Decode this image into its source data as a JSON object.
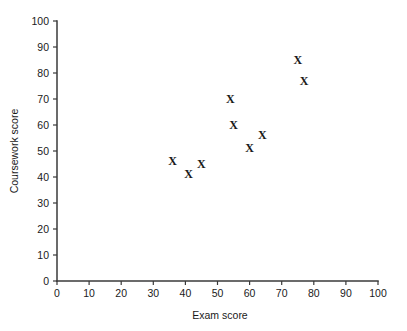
{
  "chart_data": {
    "type": "scatter",
    "title": "",
    "xlabel": "Exam score",
    "ylabel": "Coursework score",
    "xlim": [
      0,
      100
    ],
    "ylim": [
      0,
      100
    ],
    "xticks": [
      0,
      10,
      20,
      30,
      40,
      50,
      60,
      70,
      80,
      90,
      100
    ],
    "yticks": [
      0,
      10,
      20,
      30,
      40,
      50,
      60,
      70,
      80,
      90,
      100
    ],
    "xtick_labels": [
      "0",
      "10",
      "20",
      "30",
      "40",
      "50",
      "60",
      "70",
      "80",
      "90",
      "100"
    ],
    "ytick_labels": [
      "0",
      "10",
      "20",
      "30",
      "40",
      "50",
      "60",
      "70",
      "80",
      "90",
      "100"
    ],
    "grid": false,
    "legend": false,
    "marker": "X",
    "marker_color": "#1a1a1a",
    "series": [
      {
        "name": "students",
        "points": [
          {
            "x": 36,
            "y": 46
          },
          {
            "x": 41,
            "y": 41
          },
          {
            "x": 45,
            "y": 45
          },
          {
            "x": 54,
            "y": 70
          },
          {
            "x": 55,
            "y": 60
          },
          {
            "x": 60,
            "y": 51
          },
          {
            "x": 64,
            "y": 56
          },
          {
            "x": 75,
            "y": 85
          },
          {
            "x": 77,
            "y": 77
          }
        ]
      }
    ]
  },
  "axes": {
    "x_axis_name": "exam-score-axis",
    "y_axis_name": "coursework-score-axis"
  }
}
